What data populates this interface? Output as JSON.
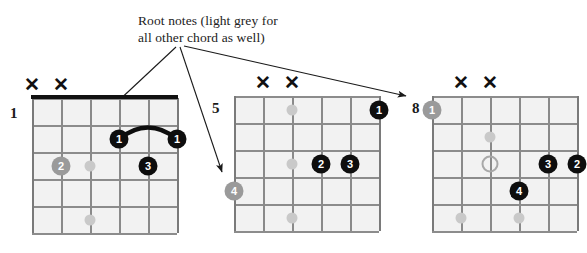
{
  "annotation": {
    "line1": "Root notes (light grey for",
    "line2": "all other chord as well)"
  },
  "colors": {
    "finger_dot": "#0e0e0e",
    "root_dot": "#9a9a9a",
    "ghost_dot": "#c9c9c9",
    "hollow_dot_border": "#a8a8a8",
    "nut": "#111111",
    "fret_line": "#8c8c8c",
    "string_line": "#8a8a8a",
    "grid_fill": "#f2f2f2",
    "text": "#1a1a1a"
  },
  "diagrams": [
    {
      "id": "chord-diagram-1",
      "fret_label": "1",
      "has_nut": true,
      "strings": 6,
      "frets": 5,
      "muted_strings": [
        1,
        2
      ],
      "barre": {
        "from_string": 4,
        "to_string": 6,
        "fret": 2,
        "finger": "1"
      },
      "dots": [
        {
          "name": "finger-dot-1a",
          "string": 4,
          "fret": 2,
          "label": "1",
          "style": "black"
        },
        {
          "name": "finger-dot-1b",
          "string": 6,
          "fret": 2,
          "label": "1",
          "style": "black"
        },
        {
          "name": "root-dot-2",
          "string": 2,
          "fret": 3,
          "label": "2",
          "style": "grey"
        },
        {
          "name": "finger-dot-3",
          "string": 5,
          "fret": 3,
          "label": "3",
          "style": "black"
        },
        {
          "name": "ghost-dot-a",
          "string": 3,
          "fret": 3,
          "label": "",
          "style": "plain"
        },
        {
          "name": "ghost-dot-b",
          "string": 3,
          "fret": 5,
          "label": "",
          "style": "plain"
        }
      ]
    },
    {
      "id": "chord-diagram-2",
      "fret_label": "5",
      "has_nut": false,
      "strings": 6,
      "frets": 5,
      "muted_strings": [
        2,
        3
      ],
      "barre": null,
      "dots": [
        {
          "name": "finger-dot-1",
          "string": 6,
          "fret": 1,
          "label": "1",
          "style": "black"
        },
        {
          "name": "finger-dot-2",
          "string": 4,
          "fret": 3,
          "label": "2",
          "style": "black"
        },
        {
          "name": "finger-dot-3",
          "string": 5,
          "fret": 3,
          "label": "3",
          "style": "black"
        },
        {
          "name": "root-dot-4",
          "string": 1,
          "fret": 4,
          "label": "4",
          "style": "grey"
        },
        {
          "name": "ghost-dot-a",
          "string": 3,
          "fret": 1,
          "label": "",
          "style": "plain"
        },
        {
          "name": "ghost-dot-b",
          "string": 3,
          "fret": 3,
          "label": "",
          "style": "plain"
        },
        {
          "name": "ghost-dot-c",
          "string": 3,
          "fret": 5,
          "label": "",
          "style": "plain"
        }
      ]
    },
    {
      "id": "chord-diagram-3",
      "fret_label": "8",
      "has_nut": false,
      "strings": 6,
      "frets": 5,
      "muted_strings": [
        2,
        3
      ],
      "barre": null,
      "dots": [
        {
          "name": "root-dot-1",
          "string": 1,
          "fret": 1,
          "label": "1",
          "style": "grey"
        },
        {
          "name": "hollow-dot",
          "string": 3,
          "fret": 3,
          "label": "",
          "style": "hollow"
        },
        {
          "name": "finger-dot-3",
          "string": 5,
          "fret": 3,
          "label": "3",
          "style": "black"
        },
        {
          "name": "finger-dot-2",
          "string": 6,
          "fret": 3,
          "label": "2",
          "style": "black"
        },
        {
          "name": "finger-dot-4",
          "string": 4,
          "fret": 4,
          "label": "4",
          "style": "black"
        },
        {
          "name": "ghost-dot-a",
          "string": 3,
          "fret": 2,
          "label": "",
          "style": "plain"
        },
        {
          "name": "ghost-dot-b",
          "string": 2,
          "fret": 5,
          "label": "",
          "style": "plain"
        },
        {
          "name": "ghost-dot-c",
          "string": 4,
          "fret": 5,
          "label": "",
          "style": "plain"
        }
      ]
    }
  ],
  "arrows": [
    {
      "name": "arrow-to-diagram-1",
      "x1": 176,
      "y1": 47,
      "x2": 68,
      "y2": 148
    },
    {
      "name": "arrow-to-diagram-2",
      "x1": 180,
      "y1": 47,
      "x2": 222,
      "y2": 172
    },
    {
      "name": "arrow-to-diagram-3",
      "x1": 184,
      "y1": 46,
      "x2": 406,
      "y2": 96
    }
  ],
  "geometry": {
    "diagram_origins": [
      {
        "grid_x": 32,
        "grid_y": 98
      },
      {
        "grid_x": 234,
        "grid_y": 96
      },
      {
        "grid_x": 432,
        "grid_y": 96
      }
    ],
    "fretnum_positions": [
      {
        "x": 10,
        "y": 105
      },
      {
        "x": 212,
        "y": 100
      },
      {
        "x": 412,
        "y": 100
      }
    ],
    "string_spacing": 29,
    "fret_spacing": 27,
    "dot_size": 19,
    "ghost_dot_size": 11
  },
  "x_marker_glyph": "✕"
}
